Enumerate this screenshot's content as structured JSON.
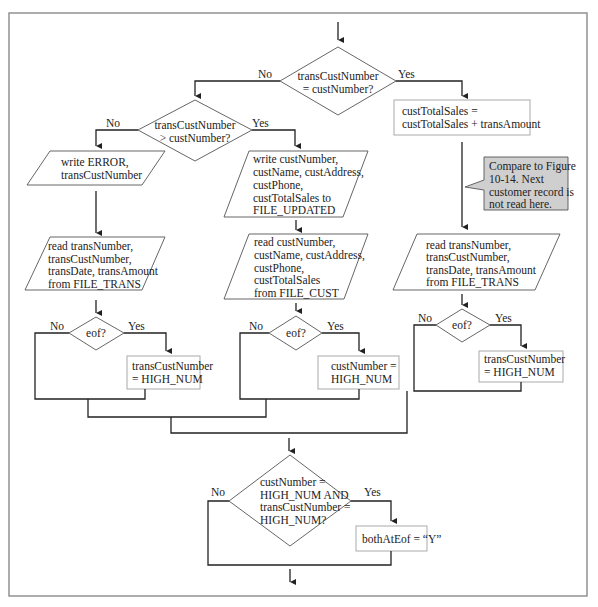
{
  "flowchart": {
    "decisions": {
      "main": {
        "lines": [
          "transCustNumber",
          "= custNumber?"
        ],
        "no": "No",
        "yes": "Yes"
      },
      "greater": {
        "lines": [
          "transCustNumber",
          "> custNumber?"
        ],
        "no": "No",
        "yes": "Yes"
      },
      "eof_left": {
        "lines": [
          "eof?"
        ],
        "no": "No",
        "yes": "Yes"
      },
      "eof_middle": {
        "lines": [
          "eof?"
        ],
        "no": "No",
        "yes": "Yes"
      },
      "eof_right": {
        "lines": [
          "eof?"
        ],
        "no": "No",
        "yes": "Yes"
      },
      "both_eof": {
        "lines": [
          "custNumber =",
          "HIGH_NUM AND",
          "transCustNumber =",
          "HIGH_NUM?"
        ],
        "no": "No",
        "yes": "Yes"
      }
    },
    "processes": {
      "accumulate": {
        "lines": [
          "custTotalSales =",
          "custTotalSales + transAmount"
        ]
      },
      "left_high": {
        "lines": [
          "transCustNumber",
          "= HIGH_NUM"
        ]
      },
      "middle_high": {
        "lines": [
          "custNumber =",
          "HIGH_NUM"
        ]
      },
      "right_high": {
        "lines": [
          "transCustNumber",
          "= HIGH_NUM"
        ]
      },
      "set_both": {
        "lines": [
          "bothAtEof = “Y”"
        ]
      }
    },
    "io": {
      "write_error": {
        "lines": [
          "write ERROR,",
          "transCustNumber"
        ]
      },
      "write_cust": {
        "lines": [
          "write custNumber,",
          "custName, custAddress,",
          "custPhone,",
          "custTotalSales to",
          "FILE_UPDATED"
        ]
      },
      "read_trans_left": {
        "lines": [
          "read transNumber,",
          "transCustNumber,",
          "transDate, transAmount",
          "from FILE_TRANS"
        ]
      },
      "read_cust": {
        "lines": [
          "read custNumber,",
          "custName, custAddress,",
          "custPhone,",
          "custTotalSales",
          "from FILE_CUST"
        ]
      },
      "read_trans_right": {
        "lines": [
          "read transNumber,",
          "transCustNumber,",
          "transDate, transAmount",
          "from FILE_TRANS"
        ]
      }
    },
    "callout": {
      "lines": [
        "Compare to Figure",
        "10-14. Next",
        "customer record is",
        "not read here."
      ]
    },
    "colors": {
      "line": "#222222",
      "shape_border": "#555555",
      "process_border": "#aaaaaa",
      "callout_fill": "#cfcfcf",
      "frame": "#8a8a8a"
    }
  }
}
